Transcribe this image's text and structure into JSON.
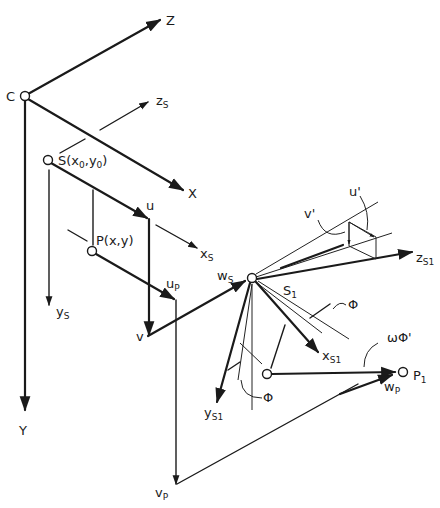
{
  "header": {
    "text": ""
  },
  "diagram": {
    "points": {
      "C": {
        "label": "C",
        "x": 25,
        "y": 96
      },
      "S": {
        "label": "S(x",
        "sub0": "0",
        "mid": ",y",
        "sub1": "0",
        "end": ")",
        "x": 48,
        "y": 160
      },
      "P": {
        "label": "P(x,y)",
        "x": 92,
        "y": 251
      },
      "S1": {
        "label": "S",
        "sub": "1",
        "x": 252,
        "y": 278
      },
      "Q": {
        "label": "",
        "x": 267,
        "y": 374
      },
      "P1": {
        "label": "P",
        "sub": "1",
        "x": 404,
        "y": 372
      }
    },
    "axes": {
      "Z": "Z",
      "X": "X",
      "Y": "Y",
      "zs": {
        "main": "z",
        "sub": "S"
      },
      "xs": {
        "main": "x",
        "sub": "S"
      },
      "ys": {
        "main": "y",
        "sub": "S"
      },
      "zs1": {
        "main": "z",
        "sub": "S1"
      },
      "xs1": {
        "main": "x",
        "sub": "S1"
      },
      "ys1": {
        "main": "y",
        "sub": "S1"
      }
    },
    "vectors": {
      "u": "u",
      "v": "v",
      "up": {
        "main": "u",
        "sub": "P"
      },
      "vp": {
        "main": "v",
        "sub": "P"
      },
      "ws": {
        "main": "w",
        "sub": "S"
      },
      "wp": {
        "main": "w",
        "sub": "P"
      },
      "u_prime": "u'",
      "v_prime": "v'"
    },
    "angles": {
      "phi_upper": "Φ",
      "phi_lower": "Φ",
      "omega_phi_prime": "ωΦ'"
    }
  }
}
